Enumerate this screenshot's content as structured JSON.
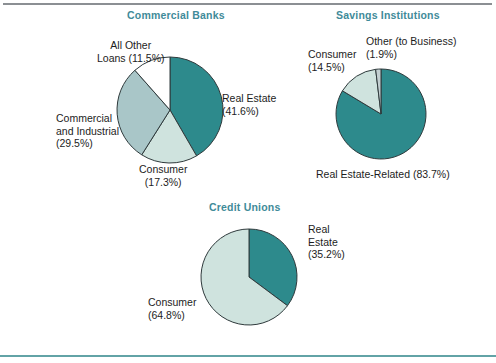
{
  "figure": {
    "background": "#ffffff",
    "top_rule_color": "#8b8f93",
    "bottom_rule_color": "#62a3a6",
    "title_color": "#3f8b99",
    "label_color": "#1d1d1d",
    "outline_color": "#2f3a3c"
  },
  "palette": {
    "dark_teal": "#2d8a8c",
    "mid_teal_gray": "#a9c6c8",
    "pale_mint": "#cfe3de",
    "white": "#ffffff",
    "light_gray": "#c3cfd1"
  },
  "chart_data": [
    {
      "type": "pie",
      "id": "commercial-banks",
      "title": "Commercial Banks",
      "categories": [
        "Real Estate",
        "Consumer",
        "Commercial and Industrial",
        "All Other Loans"
      ],
      "values": [
        41.6,
        17.3,
        29.5,
        11.5
      ],
      "colors": [
        "#2d8a8c",
        "#cfe3de",
        "#a9c6c8",
        "#ffffff"
      ],
      "start_angle": 0,
      "direction": "clockwise",
      "labels": [
        {
          "lines": [
            "Real Estate",
            "(41.6%)"
          ],
          "align": "right"
        },
        {
          "lines": [
            "Consumer",
            "(17.3%)"
          ],
          "align": "center"
        },
        {
          "lines": [
            "Commercial",
            "and Industrial",
            "(29.5%)"
          ],
          "align": "left"
        },
        {
          "lines": [
            "All Other",
            "Loans (11.5%)"
          ],
          "align": "center"
        }
      ]
    },
    {
      "type": "pie",
      "id": "savings-institutions",
      "title": "Savings Institutions",
      "categories": [
        "Real Estate-Related",
        "Consumer",
        "Other (to Business)"
      ],
      "values": [
        83.7,
        14.5,
        1.9
      ],
      "colors": [
        "#2d8a8c",
        "#cfe3de",
        "#c3cfd1"
      ],
      "start_angle": 0,
      "direction": "clockwise",
      "labels": [
        {
          "lines": [
            "Real Estate-Related (83.7%)"
          ],
          "align": "center"
        },
        {
          "lines": [
            "Consumer",
            "(14.5%)"
          ],
          "align": "left"
        },
        {
          "lines": [
            "Other (to Business)",
            "(1.9%)"
          ],
          "align": "left"
        }
      ]
    },
    {
      "type": "pie",
      "id": "credit-unions",
      "title": "Credit Unions",
      "categories": [
        "Real Estate",
        "Consumer"
      ],
      "values": [
        35.2,
        64.8
      ],
      "colors": [
        "#2d8a8c",
        "#cfe3de"
      ],
      "start_angle": 0,
      "direction": "clockwise",
      "labels": [
        {
          "lines": [
            "Real",
            "Estate",
            "(35.2%)"
          ],
          "align": "right"
        },
        {
          "lines": [
            "Consumer",
            "(64.8%)"
          ],
          "align": "left"
        }
      ]
    }
  ],
  "geometry": {
    "commercial_banks": {
      "cx": 170,
      "cy": 110,
      "r": 53,
      "title_left": 127,
      "title_top": 9,
      "label_positions": [
        {
          "left": 222,
          "top": 92
        },
        {
          "left": 139,
          "top": 163
        },
        {
          "left": 56,
          "top": 112
        },
        {
          "left": 97,
          "top": 39
        }
      ]
    },
    "savings_institutions": {
      "cx": 381,
      "cy": 114,
      "r": 45,
      "title_left": 336,
      "title_top": 9,
      "label_positions": [
        {
          "left": 316,
          "top": 168
        },
        {
          "left": 308,
          "top": 48
        },
        {
          "left": 366,
          "top": 35
        }
      ]
    },
    "credit_unions": {
      "cx": 249,
      "cy": 277,
      "r": 48,
      "title_left": 209,
      "title_top": 201,
      "label_positions": [
        {
          "left": 308,
          "top": 223
        },
        {
          "left": 148,
          "top": 296
        }
      ]
    }
  }
}
